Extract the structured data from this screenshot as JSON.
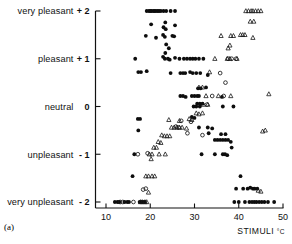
{
  "figure": {
    "panel_label": "(a)",
    "x_axis": {
      "title": "STIMULI",
      "unit": "°C",
      "ticks": [
        10,
        20,
        30,
        40,
        50
      ],
      "range": [
        8.0,
        50.5
      ]
    },
    "y_axis": {
      "range": [
        -2.3,
        2.3
      ],
      "ticks": [
        {
          "value": 2,
          "number": "+ 2",
          "label": "very pleasant"
        },
        {
          "value": 1,
          "number": "+ 1",
          "label": "pleasant"
        },
        {
          "value": 0,
          "number": "0",
          "label": "neutral"
        },
        {
          "value": -1,
          "number": "- 1",
          "label": "unpleasant"
        },
        {
          "value": -2,
          "number": "- 2",
          "label": "very unpleasant"
        }
      ]
    }
  },
  "chart_data": {
    "type": "scatter",
    "title": "",
    "xlabel": "STIMULI °C",
    "ylabel": "",
    "xlim": [
      8.0,
      50.5
    ],
    "ylim": [
      -2.3,
      2.3
    ],
    "grid": false,
    "legend": "none",
    "series": [
      {
        "name": "filled-circle",
        "marker": "filled circle",
        "color": "#0d0d0d",
        "points": [
          [
            19.2,
            2.0
          ],
          [
            19.7,
            2.0
          ],
          [
            20.0,
            2.0
          ],
          [
            20.3,
            2.0
          ],
          [
            20.7,
            2.0
          ],
          [
            21.0,
            2.0
          ],
          [
            21.3,
            2.0
          ],
          [
            21.7,
            2.0
          ],
          [
            22.0,
            2.0
          ],
          [
            22.4,
            2.0
          ],
          [
            23.0,
            2.0
          ],
          [
            23.6,
            2.0
          ],
          [
            24.6,
            2.0
          ],
          [
            25.6,
            2.0
          ],
          [
            20.2,
            1.72
          ],
          [
            23.0,
            1.66
          ],
          [
            23.4,
            1.76
          ],
          [
            23.5,
            1.62
          ],
          [
            25.6,
            1.7
          ],
          [
            19.0,
            1.48
          ],
          [
            21.3,
            1.44
          ],
          [
            22.9,
            1.5
          ],
          [
            23.3,
            1.46
          ],
          [
            25.0,
            1.48
          ],
          [
            25.4,
            1.47
          ],
          [
            23.6,
            1.3
          ],
          [
            24.2,
            1.22
          ],
          [
            23.4,
            1.12
          ],
          [
            16.6,
            1.0
          ],
          [
            22.9,
            1.04
          ],
          [
            23.3,
            1.0
          ],
          [
            24.0,
            1.0
          ],
          [
            24.4,
            0.98
          ],
          [
            25.6,
            1.02
          ],
          [
            26.6,
            1.0
          ],
          [
            27.6,
            1.0
          ],
          [
            28.3,
            1.0
          ],
          [
            29.0,
            1.0
          ],
          [
            29.6,
            1.0
          ],
          [
            30.2,
            1.0
          ],
          [
            31.0,
            1.0
          ],
          [
            32.0,
            1.0
          ],
          [
            17.3,
            0.72
          ],
          [
            17.9,
            0.72
          ],
          [
            19.2,
            0.74
          ],
          [
            24.6,
            0.7
          ],
          [
            26.8,
            0.7
          ],
          [
            27.4,
            0.7
          ],
          [
            27.9,
            0.7
          ],
          [
            29.0,
            0.72
          ],
          [
            29.6,
            0.7
          ],
          [
            30.4,
            0.7
          ],
          [
            31.3,
            0.7
          ],
          [
            33.0,
            0.66
          ],
          [
            30.8,
            0.38
          ],
          [
            31.4,
            0.38
          ],
          [
            32.6,
            0.4
          ],
          [
            26.8,
            0.22
          ],
          [
            27.4,
            0.22
          ],
          [
            28.0,
            0.2
          ],
          [
            29.4,
            0.22
          ],
          [
            30.0,
            0.22
          ],
          [
            30.6,
            0.22
          ],
          [
            31.0,
            0.22
          ],
          [
            36.2,
            0.2
          ],
          [
            30.6,
            0.06
          ],
          [
            31.2,
            0.06
          ],
          [
            31.8,
            0.06
          ],
          [
            29.8,
            0.0
          ],
          [
            30.4,
            0.0
          ],
          [
            31.2,
            0.0
          ],
          [
            36.4,
            0.0
          ],
          [
            38.8,
            0.0
          ],
          [
            17.2,
            -0.26
          ],
          [
            17.7,
            -0.26
          ],
          [
            29.4,
            -0.22
          ],
          [
            30.0,
            -0.24
          ],
          [
            17.3,
            -0.5
          ],
          [
            31.0,
            -0.44
          ],
          [
            33.0,
            -0.44
          ],
          [
            34.0,
            -0.46
          ],
          [
            33.2,
            -0.56
          ],
          [
            36.0,
            -0.58
          ],
          [
            37.0,
            -0.58
          ],
          [
            34.6,
            -0.7
          ],
          [
            35.2,
            -0.7
          ],
          [
            35.8,
            -0.7
          ],
          [
            36.4,
            -0.7
          ],
          [
            37.0,
            -0.7
          ],
          [
            37.6,
            -0.7
          ],
          [
            38.2,
            -0.74
          ],
          [
            16.4,
            -1.0
          ],
          [
            31.6,
            -1.0
          ],
          [
            34.6,
            -1.0
          ],
          [
            36.4,
            -1.0
          ],
          [
            36.9,
            -1.0
          ],
          [
            37.4,
            -1.02
          ],
          [
            38.4,
            -0.86
          ],
          [
            16.0,
            -1.46
          ],
          [
            40.4,
            -1.46
          ],
          [
            39.4,
            -1.72
          ],
          [
            41.0,
            -1.72
          ],
          [
            42.0,
            -1.72
          ],
          [
            42.6,
            -1.7
          ],
          [
            43.2,
            -1.72
          ],
          [
            43.6,
            -1.72
          ],
          [
            44.2,
            -1.72
          ],
          [
            12.0,
            -2.0
          ],
          [
            12.6,
            -2.0
          ],
          [
            13.0,
            -2.0
          ],
          [
            14.2,
            -2.0
          ],
          [
            14.8,
            -2.0
          ],
          [
            15.2,
            -2.0
          ],
          [
            17.6,
            -2.0
          ],
          [
            18.0,
            -2.0
          ],
          [
            18.4,
            -2.0
          ],
          [
            18.8,
            -2.0
          ],
          [
            39.0,
            -2.0
          ],
          [
            40.0,
            -2.0
          ],
          [
            41.4,
            -2.0
          ],
          [
            42.4,
            -2.0
          ],
          [
            43.0,
            -2.0
          ],
          [
            43.5,
            -2.0
          ],
          [
            44.0,
            -2.0
          ],
          [
            44.6,
            -2.0
          ],
          [
            45.2,
            -2.0
          ],
          [
            45.8,
            -2.0
          ],
          [
            46.6,
            -2.0
          ],
          [
            48.0,
            -2.0
          ]
        ]
      },
      {
        "name": "open-circle",
        "marker": "open circle",
        "color": "#161616",
        "points": [
          [
            37.6,
            1.0
          ],
          [
            38.4,
            1.0
          ],
          [
            39.4,
            1.0
          ],
          [
            35.8,
            0.7
          ],
          [
            37.0,
            0.5
          ],
          [
            34.0,
            0.22
          ],
          [
            36.6,
            0.22
          ],
          [
            32.8,
            0.04
          ],
          [
            27.0,
            -0.3
          ],
          [
            29.2,
            -0.32
          ],
          [
            25.8,
            -0.42
          ],
          [
            26.4,
            -0.44
          ],
          [
            28.4,
            -0.56
          ],
          [
            31.8,
            -0.6
          ],
          [
            17.2,
            -1.0
          ],
          [
            19.4,
            -0.98
          ],
          [
            18.4,
            -1.74
          ],
          [
            19.0,
            -1.72
          ],
          [
            13.2,
            -2.0
          ],
          [
            13.8,
            -2.0
          ],
          [
            16.2,
            -2.0
          ]
        ]
      },
      {
        "name": "open-triangle",
        "marker": "open triangle",
        "color": "#161616",
        "points": [
          [
            41.6,
            2.0
          ],
          [
            42.2,
            2.0
          ],
          [
            42.8,
            2.0
          ],
          [
            43.2,
            2.0
          ],
          [
            43.8,
            2.0
          ],
          [
            44.4,
            2.0
          ],
          [
            45.0,
            2.0
          ],
          [
            42.6,
            1.78
          ],
          [
            43.4,
            1.78
          ],
          [
            36.0,
            1.48
          ],
          [
            38.2,
            1.48
          ],
          [
            38.8,
            1.48
          ],
          [
            40.4,
            1.5
          ],
          [
            40.9,
            1.5
          ],
          [
            41.4,
            1.5
          ],
          [
            43.2,
            1.44
          ],
          [
            37.6,
            1.22
          ],
          [
            38.0,
            1.28
          ],
          [
            34.6,
            1.0
          ],
          [
            37.4,
            1.0
          ],
          [
            38.0,
            1.0
          ],
          [
            39.6,
            1.0
          ],
          [
            33.4,
            0.72
          ],
          [
            46.8,
            0.26
          ],
          [
            31.0,
            0.4
          ],
          [
            31.8,
            0.4
          ],
          [
            32.6,
            0.22
          ],
          [
            35.4,
            0.22
          ],
          [
            38.2,
            0.22
          ],
          [
            32.0,
            0.04
          ],
          [
            33.0,
            0.04
          ],
          [
            30.4,
            -0.14
          ],
          [
            31.0,
            -0.16
          ],
          [
            31.8,
            -0.14
          ],
          [
            24.2,
            -0.28
          ],
          [
            26.6,
            -0.3
          ],
          [
            28.8,
            -0.26
          ],
          [
            29.4,
            -0.28
          ],
          [
            45.4,
            -0.52
          ],
          [
            46.0,
            -0.5
          ],
          [
            24.8,
            -0.44
          ],
          [
            25.4,
            -0.44
          ],
          [
            26.0,
            -0.44
          ],
          [
            26.6,
            -0.44
          ],
          [
            27.2,
            -0.44
          ],
          [
            28.2,
            -0.46
          ],
          [
            22.6,
            -0.6
          ],
          [
            23.2,
            -0.62
          ],
          [
            23.8,
            -0.62
          ],
          [
            24.4,
            -0.62
          ],
          [
            21.8,
            -0.74
          ],
          [
            22.4,
            -0.76
          ],
          [
            20.8,
            -0.86
          ],
          [
            21.4,
            -0.86
          ],
          [
            19.8,
            -1.0
          ],
          [
            20.4,
            -1.0
          ],
          [
            22.0,
            -1.0
          ],
          [
            23.4,
            -1.0
          ],
          [
            20.2,
            -1.1
          ],
          [
            19.0,
            -1.46
          ],
          [
            19.6,
            -1.46
          ],
          [
            20.4,
            -1.46
          ],
          [
            21.0,
            -1.46
          ],
          [
            19.6,
            -1.8
          ],
          [
            17.8,
            -2.0
          ],
          [
            18.2,
            -2.0
          ],
          [
            18.8,
            -2.0
          ],
          [
            19.2,
            -2.0
          ],
          [
            44.4,
            -1.76
          ],
          [
            45.0,
            -1.78
          ]
        ]
      }
    ]
  }
}
